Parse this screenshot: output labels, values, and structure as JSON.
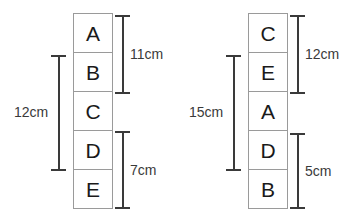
{
  "figure": {
    "type": "block-stack-dimension-diagram",
    "background_color": "#ffffff",
    "block_border_color": "#9a9a9a",
    "dimension_line_color": "#3a3a3a",
    "text_color": "#3a3a3a",
    "unit": "cm"
  },
  "left_figure": {
    "name": "left-stack-diagram",
    "blocks": [
      {
        "label": "A"
      },
      {
        "label": "B"
      },
      {
        "label": "C"
      },
      {
        "label": "D"
      },
      {
        "label": "E"
      }
    ],
    "dimensions": [
      {
        "id": "left-12cm",
        "value": "12cm",
        "side": "left",
        "spans_blocks": [
          "B",
          "C",
          "D"
        ]
      },
      {
        "id": "left-11cm",
        "value": "11cm",
        "side": "right",
        "spans_blocks": [
          "A",
          "B"
        ]
      },
      {
        "id": "left-7cm",
        "value": "7cm",
        "side": "right",
        "spans_blocks": [
          "D",
          "E"
        ]
      }
    ]
  },
  "right_figure": {
    "name": "right-stack-diagram",
    "blocks": [
      {
        "label": "C"
      },
      {
        "label": "E"
      },
      {
        "label": "A"
      },
      {
        "label": "D"
      },
      {
        "label": "B"
      }
    ],
    "dimensions": [
      {
        "id": "right-15cm",
        "value": "15cm",
        "side": "left",
        "spans_blocks": [
          "E",
          "A",
          "D"
        ]
      },
      {
        "id": "right-12cm",
        "value": "12cm",
        "side": "right",
        "spans_blocks": [
          "C",
          "E"
        ]
      },
      {
        "id": "right-5cm",
        "value": "5cm",
        "side": "right",
        "spans_blocks": [
          "D",
          "B"
        ]
      }
    ]
  }
}
